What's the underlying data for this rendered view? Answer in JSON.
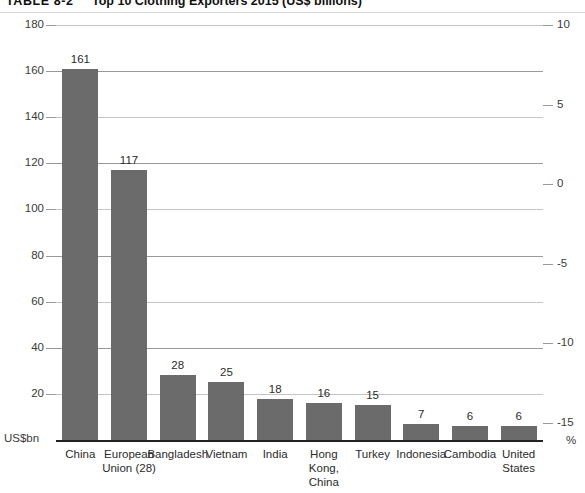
{
  "caption": {
    "table_number": "TABLE 8-2",
    "title": "Top 10 Clothing Exporters 2015 (US$ billions)"
  },
  "axes": {
    "left_unit": "US$bn",
    "right_unit": "%",
    "left_ticks": [
      "180",
      "160",
      "140",
      "120",
      "100",
      "80",
      "60",
      "40",
      "20"
    ],
    "right_ticks": [
      "10",
      "5",
      "0",
      "-5",
      "-10",
      "-15"
    ]
  },
  "chart_data": {
    "type": "bar",
    "title": "Top 10 Clothing Exporters 2015 (US$ billions)",
    "categories": [
      "China",
      "European Union (28)",
      "Bangladesh",
      "Vietnam",
      "India",
      "Hong Kong, China",
      "Turkey",
      "Indonesia",
      "Cambodia",
      "United States"
    ],
    "category_lines": [
      [
        "China"
      ],
      [
        "European",
        "Union (28)"
      ],
      [
        "Bangladesh"
      ],
      [
        "Vietnam"
      ],
      [
        "India"
      ],
      [
        "Hong Kong,",
        "China"
      ],
      [
        "Turkey"
      ],
      [
        "Indonesia"
      ],
      [
        "Cambodia"
      ],
      [
        "United",
        "States"
      ]
    ],
    "values": [
      161,
      117,
      28,
      25,
      18,
      16,
      15,
      7,
      6,
      6
    ],
    "value_labels": [
      "161",
      "117",
      "28",
      "25",
      "18",
      "16",
      "15",
      "7",
      "6",
      "6"
    ],
    "xlabel": "",
    "ylabel": "US$bn",
    "ylim": [
      0,
      180
    ],
    "y2label": "%",
    "y2lim": [
      -20,
      10
    ],
    "grid": true,
    "legend": null,
    "bar_color": "#6b6b6b"
  }
}
